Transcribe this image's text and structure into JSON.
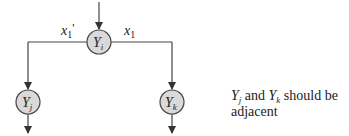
{
  "diagram": {
    "nodes": [
      {
        "id": "Yi",
        "label": "Y",
        "subscript": "i",
        "cx": 99,
        "cy": 42,
        "r": 12
      },
      {
        "id": "Yj",
        "label": "Y",
        "subscript": "j",
        "cx": 28,
        "cy": 102,
        "r": 12
      },
      {
        "id": "Yk",
        "label": "Y",
        "subscript": "k",
        "cx": 172,
        "cy": 102,
        "r": 12
      }
    ],
    "edges": [
      {
        "from": "input",
        "to": "Yi",
        "label": ""
      },
      {
        "from": "Yi",
        "to": "Yj",
        "label": "x1'"
      },
      {
        "from": "Yi",
        "to": "Yk",
        "label": "x1"
      },
      {
        "from": "Yj",
        "to": "output",
        "label": ""
      },
      {
        "from": "Yk",
        "to": "output",
        "label": ""
      }
    ],
    "edge_labels": {
      "left": {
        "base": "x",
        "sub": "1",
        "suffix": "'"
      },
      "right": {
        "base": "x",
        "sub": "1",
        "suffix": ""
      }
    },
    "colors": {
      "node_fill": "#d9d9d9",
      "stroke": "#444444",
      "text": "#222222"
    }
  },
  "note": {
    "y1": "Y",
    "y1_sub": "j",
    "and": " and ",
    "y2": "Y",
    "y2_sub": "k",
    "rest": " should be",
    "line2": "adjacent"
  }
}
